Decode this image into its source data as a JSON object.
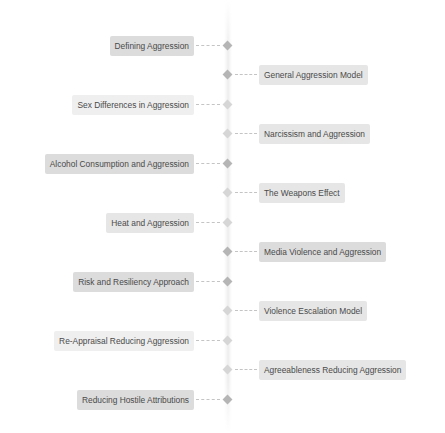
{
  "diagram": {
    "type": "vertical-timeline",
    "colors": {
      "node": "#b5b5b5",
      "node_light": "#d6d6d6",
      "connector": "#c4c4c4",
      "label_text": "#4a4a4a",
      "label_bg_dark": "#dcdcdc",
      "label_bg_mid": "#e6e6e6",
      "label_bg_pale": "#efefef"
    },
    "items": [
      {
        "label": "Defining Aggression",
        "side": "left"
      },
      {
        "label": "General Aggression Model",
        "side": "right"
      },
      {
        "label": "Sex Differences in Aggression",
        "side": "left"
      },
      {
        "label": "Narcissism and Aggression",
        "side": "right"
      },
      {
        "label": "Alcohol Consumption and Aggression",
        "side": "left"
      },
      {
        "label": "The Weapons Effect",
        "side": "right"
      },
      {
        "label": "Heat and Aggression",
        "side": "left"
      },
      {
        "label": "Media Violence and Aggression",
        "side": "right"
      },
      {
        "label": "Risk and Resiliency Approach",
        "side": "left"
      },
      {
        "label": "Violence Escalation Model",
        "side": "right"
      },
      {
        "label": "Re-Appraisal Reducing Aggression",
        "side": "left"
      },
      {
        "label": "Agreeableness Reducing Aggression",
        "side": "right"
      },
      {
        "label": "Reducing Hostile Attributions",
        "side": "left"
      }
    ]
  }
}
